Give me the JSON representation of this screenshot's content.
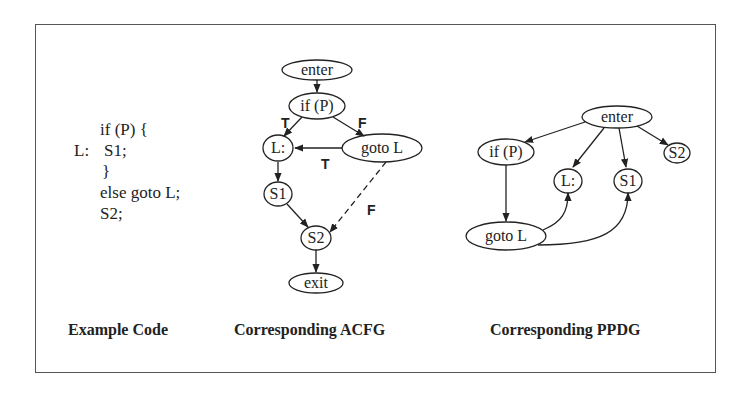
{
  "example_code": {
    "lines": [
      {
        "label": "",
        "text": "if (P) {"
      },
      {
        "label": "L:",
        "text": "S1;"
      },
      {
        "label": "",
        "text": "}"
      },
      {
        "label": "",
        "text": "else goto L;"
      },
      {
        "label": "",
        "text": "S2;"
      }
    ],
    "caption": "Example Code"
  },
  "acfg": {
    "caption": "Corresponding ACFG",
    "nodes": {
      "enter": "enter",
      "ifp": "if (P)",
      "l": "L:",
      "gotol": "goto L",
      "s1": "S1",
      "s2": "S2",
      "exit": "exit"
    },
    "edges": [
      {
        "from": "enter",
        "to": "if (P)",
        "label": "",
        "style": "solid"
      },
      {
        "from": "if (P)",
        "to": "L:",
        "label": "T",
        "style": "solid"
      },
      {
        "from": "if (P)",
        "to": "goto L",
        "label": "F",
        "style": "solid"
      },
      {
        "from": "goto L",
        "to": "L:",
        "label": "T",
        "style": "solid"
      },
      {
        "from": "goto L",
        "to": "S2",
        "label": "F",
        "style": "dashed"
      },
      {
        "from": "L:",
        "to": "S1",
        "label": "",
        "style": "solid"
      },
      {
        "from": "S1",
        "to": "S2",
        "label": "",
        "style": "solid"
      },
      {
        "from": "S2",
        "to": "exit",
        "label": "",
        "style": "solid"
      }
    ],
    "labels": {
      "t1": "T",
      "f1": "F",
      "t2": "T",
      "f2": "F"
    }
  },
  "ppdg": {
    "caption": "Corresponding PPDG",
    "nodes": {
      "enter": "enter",
      "ifp": "if (P)",
      "l": "L:",
      "s1": "S1",
      "s2": "S2",
      "gotol": "goto L"
    },
    "edges": [
      {
        "from": "enter",
        "to": "if (P)"
      },
      {
        "from": "enter",
        "to": "L:"
      },
      {
        "from": "enter",
        "to": "S1"
      },
      {
        "from": "enter",
        "to": "S2"
      },
      {
        "from": "if (P)",
        "to": "goto L"
      },
      {
        "from": "goto L",
        "to": "L:"
      },
      {
        "from": "goto L",
        "to": "S1"
      }
    ]
  }
}
